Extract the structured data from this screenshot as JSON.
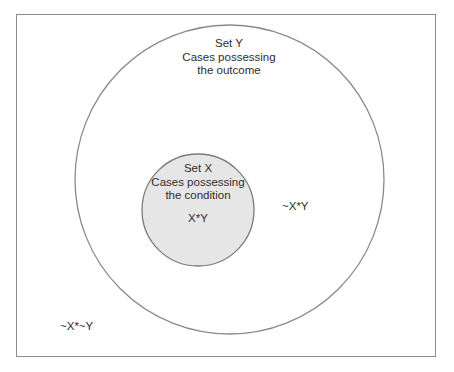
{
  "diagram": {
    "type": "venn-subset",
    "colors": {
      "frame_border": "#8c8c8c",
      "circle_stroke": "#8a8a8a",
      "set_x_fill": "#e6e6e6",
      "set_y_fill": "#ffffff",
      "text": "#2e2e2e"
    },
    "universe": {
      "label": "~X*~Y"
    },
    "set_y": {
      "title": "Set Y",
      "line1": "Cases possessing",
      "line2": "the outcome",
      "region_label": "~X*Y"
    },
    "set_x": {
      "title": "Set X",
      "line1": "Cases possessing",
      "line2": "the condition",
      "region_label": "X*Y"
    }
  }
}
